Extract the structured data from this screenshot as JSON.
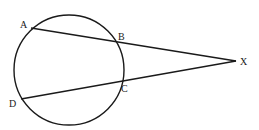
{
  "diagram": {
    "circle": {
      "cx": 69,
      "cy": 70,
      "r": 55
    },
    "external_point": {
      "label": "X",
      "x": 236,
      "y": 61
    },
    "points": [
      {
        "label": "A",
        "x": 31,
        "y": 28
      },
      {
        "label": "B",
        "x": 116,
        "y": 42
      },
      {
        "label": "C",
        "x": 122,
        "y": 80
      },
      {
        "label": "D",
        "x": 21,
        "y": 99
      }
    ],
    "secants": [
      {
        "from": "A",
        "through": "B",
        "to": "X"
      },
      {
        "from": "D",
        "through": "C",
        "to": "X"
      }
    ],
    "labels": {
      "A": "A",
      "B": "B",
      "C": "C",
      "D": "D",
      "X": "X"
    }
  }
}
